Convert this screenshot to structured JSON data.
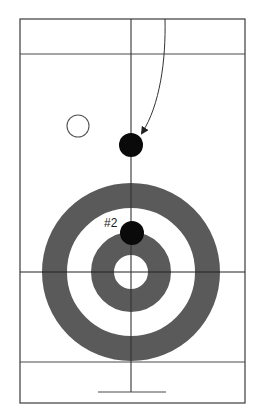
{
  "diagram": {
    "type": "curling-sheet",
    "colors": {
      "line": "#4a4a4a",
      "ring": "#5a5a5a",
      "stone": "#0a0a0a",
      "background": "#ffffff"
    },
    "house": {
      "center": [
        131,
        272
      ],
      "rings": [
        {
          "name": "12-foot",
          "outer_radius": 89,
          "inner_radius": 64
        },
        {
          "name": "4-foot",
          "outer_radius": 40,
          "inner_radius": 17
        }
      ]
    },
    "stones": [
      {
        "id": "stone-1",
        "cx": 131,
        "cy": 145,
        "r": 12,
        "filled": true,
        "label": ""
      },
      {
        "id": "stone-2",
        "cx": 132,
        "cy": 233,
        "r": 12,
        "filled": true,
        "label": "#2"
      },
      {
        "id": "stone-open",
        "cx": 78,
        "cy": 126,
        "r": 11,
        "filled": false,
        "label": ""
      }
    ],
    "arrow": {
      "from": [
        165,
        19
      ],
      "to": [
        142,
        133
      ]
    },
    "labels": {
      "stone2": "#2"
    }
  }
}
